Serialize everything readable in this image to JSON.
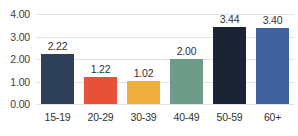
{
  "chart_data": {
    "type": "bar",
    "title": "",
    "subtitle": "",
    "xlabel": "",
    "ylabel": "",
    "categories": [
      "15-19",
      "20-29",
      "30-39",
      "40-49",
      "50-59",
      "60+"
    ],
    "values": [
      2.22,
      1.22,
      1.02,
      2.0,
      3.44,
      3.4
    ],
    "data_labels": [
      "2.22",
      "1.22",
      "1.02",
      "2.00",
      "3.44",
      "3.40"
    ],
    "bar_colors": [
      "#2E4059",
      "#E8503A",
      "#F0AE3C",
      "#6F9C88",
      "#1C2333",
      "#41629E"
    ],
    "ylim": [
      0,
      4
    ],
    "ytick_values": [
      4,
      3,
      2,
      1,
      0
    ],
    "ytick_labels": [
      "4.00",
      "3.00",
      "2.00",
      "1.00",
      "0.00"
    ],
    "grid": true,
    "grid_color": "#E2E2E2",
    "legend": false,
    "legend_position": "none",
    "axis_label_color": "#404040",
    "data_label_color": "#333333",
    "background": "#FFFFFF"
  }
}
